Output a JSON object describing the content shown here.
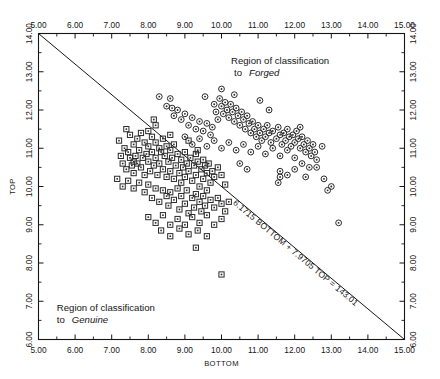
{
  "chart_data": {
    "type": "scatter",
    "title": "",
    "xlabel": "BOTTOM",
    "ylabel": "TOP",
    "xlim": [
      5.0,
      15.0
    ],
    "ylim": [
      6.0,
      14.0
    ],
    "xticks": [
      "5.00",
      "6.00",
      "7.00",
      "8.00",
      "9.00",
      "10.00",
      "11.00",
      "12.00",
      "13.00",
      "14.00",
      "15.00"
    ],
    "yticks": [
      "6.00",
      "7.00",
      "8.00",
      "9.00",
      "10.00",
      "11.00",
      "12.00",
      "13.00",
      "14.00"
    ],
    "xtick_values": [
      5,
      6,
      7,
      8,
      9,
      10,
      11,
      12,
      13,
      14,
      15
    ],
    "ytick_values": [
      6,
      7,
      8,
      9,
      10,
      11,
      12,
      13,
      14
    ],
    "grid": false,
    "legend_position": "none",
    "axes_mirrored": true,
    "annotations": [
      {
        "name": "forged-region-label",
        "line1": "Region of classification",
        "line2": "to",
        "emph": "Forged",
        "x": 11.6,
        "y": 13.2
      },
      {
        "name": "genuine-region-label",
        "line1": "Region of classification",
        "line2": "to",
        "emph": "Genuine",
        "x": 5.5,
        "y": 6.75
      },
      {
        "name": "boundary-equation",
        "text": "6.1715 BOTTOM + 7.9705 TOP = 143.01",
        "rotated": true
      }
    ],
    "boundary_line": {
      "name": "discriminant-boundary",
      "equation": "6.1715 BOTTOM + 7.9705 TOP = 143.01",
      "slope_coef_bottom": 6.1715,
      "slope_coef_top": 7.9705,
      "constant": 143.01,
      "endpoints": [
        [
          5.0,
          14.0
        ],
        [
          15.0,
          6.0
        ]
      ]
    },
    "series": [
      {
        "name": "Genuine",
        "marker": "square-dot",
        "points": [
          [
            7.2,
            11.2
          ],
          [
            7.25,
            10.8
          ],
          [
            7.3,
            10.6
          ],
          [
            7.35,
            11.0
          ],
          [
            7.4,
            10.45
          ],
          [
            7.45,
            10.9
          ],
          [
            7.5,
            11.35
          ],
          [
            7.5,
            10.75
          ],
          [
            7.55,
            10.55
          ],
          [
            7.6,
            11.1
          ],
          [
            7.6,
            10.35
          ],
          [
            7.65,
            10.8
          ],
          [
            7.7,
            11.25
          ],
          [
            7.7,
            10.6
          ],
          [
            7.75,
            10.95
          ],
          [
            7.8,
            11.4
          ],
          [
            7.8,
            10.5
          ],
          [
            7.85,
            10.75
          ],
          [
            7.9,
            11.15
          ],
          [
            7.9,
            10.3
          ],
          [
            7.95,
            10.85
          ],
          [
            8.0,
            11.45
          ],
          [
            8.0,
            11.05
          ],
          [
            8.0,
            10.65
          ],
          [
            8.05,
            10.4
          ],
          [
            8.1,
            11.3
          ],
          [
            8.1,
            10.9
          ],
          [
            8.15,
            10.55
          ],
          [
            8.2,
            11.6
          ],
          [
            8.2,
            11.15
          ],
          [
            8.2,
            10.75
          ],
          [
            8.25,
            10.3
          ],
          [
            8.3,
            11.0
          ],
          [
            8.3,
            10.6
          ],
          [
            8.35,
            10.9
          ],
          [
            8.4,
            11.25
          ],
          [
            8.4,
            10.45
          ],
          [
            8.45,
            10.8
          ],
          [
            8.5,
            11.05
          ],
          [
            8.5,
            10.25
          ],
          [
            8.55,
            10.65
          ],
          [
            8.6,
            10.95
          ],
          [
            8.6,
            10.4
          ],
          [
            8.65,
            10.75
          ],
          [
            8.7,
            11.1
          ],
          [
            8.7,
            10.2
          ],
          [
            8.75,
            10.55
          ],
          [
            8.8,
            10.85
          ],
          [
            8.85,
            10.35
          ],
          [
            8.9,
            10.7
          ],
          [
            8.9,
            10.1
          ],
          [
            8.95,
            10.5
          ],
          [
            9.0,
            10.9
          ],
          [
            9.0,
            10.25
          ],
          [
            9.05,
            10.6
          ],
          [
            9.1,
            10.4
          ],
          [
            9.15,
            10.75
          ],
          [
            9.2,
            10.15
          ],
          [
            9.25,
            10.55
          ],
          [
            9.3,
            10.85
          ],
          [
            9.3,
            10.3
          ],
          [
            9.35,
            10.65
          ],
          [
            9.4,
            10.0
          ],
          [
            9.45,
            10.45
          ],
          [
            9.5,
            10.7
          ],
          [
            9.5,
            10.2
          ],
          [
            9.55,
            10.55
          ],
          [
            9.6,
            10.35
          ],
          [
            9.65,
            10.6
          ],
          [
            9.7,
            10.1
          ],
          [
            9.75,
            10.4
          ],
          [
            9.8,
            10.25
          ],
          [
            9.9,
            10.5
          ],
          [
            10.0,
            10.3
          ],
          [
            10.1,
            10.05
          ],
          [
            7.15,
            10.2
          ],
          [
            7.3,
            10.0
          ],
          [
            7.45,
            10.15
          ],
          [
            7.6,
            9.95
          ],
          [
            7.75,
            10.1
          ],
          [
            7.9,
            9.85
          ],
          [
            8.0,
            10.05
          ],
          [
            8.1,
            9.7
          ],
          [
            8.2,
            9.95
          ],
          [
            8.3,
            9.6
          ],
          [
            8.4,
            9.9
          ],
          [
            8.5,
            9.75
          ],
          [
            8.55,
            9.5
          ],
          [
            8.6,
            9.85
          ],
          [
            8.7,
            9.65
          ],
          [
            8.8,
            9.95
          ],
          [
            8.85,
            9.4
          ],
          [
            8.9,
            9.75
          ],
          [
            9.0,
            9.55
          ],
          [
            9.05,
            9.9
          ],
          [
            9.1,
            9.3
          ],
          [
            9.2,
            9.7
          ],
          [
            9.25,
            9.45
          ],
          [
            9.3,
            9.8
          ],
          [
            9.4,
            9.6
          ],
          [
            9.45,
            9.35
          ],
          [
            9.5,
            9.75
          ],
          [
            9.55,
            9.5
          ],
          [
            9.6,
            9.9
          ],
          [
            9.7,
            9.65
          ],
          [
            9.8,
            9.45
          ],
          [
            9.9,
            9.7
          ],
          [
            10.0,
            9.55
          ],
          [
            10.1,
            9.35
          ],
          [
            10.2,
            9.6
          ],
          [
            8.0,
            9.2
          ],
          [
            8.2,
            9.05
          ],
          [
            8.4,
            9.25
          ],
          [
            8.6,
            9.0
          ],
          [
            8.8,
            9.15
          ],
          [
            9.0,
            9.0
          ],
          [
            9.2,
            9.2
          ],
          [
            9.4,
            9.05
          ],
          [
            9.6,
            9.25
          ],
          [
            9.8,
            9.0
          ],
          [
            10.0,
            9.15
          ],
          [
            8.35,
            8.85
          ],
          [
            8.6,
            8.7
          ],
          [
            8.85,
            8.9
          ],
          [
            9.1,
            8.75
          ],
          [
            9.35,
            8.85
          ],
          [
            9.6,
            8.7
          ],
          [
            9.3,
            8.4
          ],
          [
            10.0,
            7.7
          ],
          [
            7.6,
            10.65
          ],
          [
            7.4,
            11.5
          ],
          [
            8.15,
            11.75
          ],
          [
            8.6,
            11.35
          ],
          [
            9.1,
            11.2
          ],
          [
            9.35,
            10.95
          ]
        ]
      },
      {
        "name": "Forged",
        "marker": "circle-dot",
        "points": [
          [
            8.5,
            12.1
          ],
          [
            8.65,
            12.05
          ],
          [
            8.7,
            11.85
          ],
          [
            8.8,
            12.0
          ],
          [
            8.9,
            11.75
          ],
          [
            9.0,
            11.9
          ],
          [
            9.1,
            11.6
          ],
          [
            9.2,
            11.8
          ],
          [
            9.3,
            11.5
          ],
          [
            9.4,
            11.7
          ],
          [
            9.5,
            11.45
          ],
          [
            9.6,
            11.65
          ],
          [
            9.7,
            11.35
          ],
          [
            9.75,
            11.55
          ],
          [
            9.8,
            12.15
          ],
          [
            9.85,
            11.95
          ],
          [
            9.9,
            11.75
          ],
          [
            9.95,
            12.3
          ],
          [
            10.0,
            12.1
          ],
          [
            10.05,
            11.9
          ],
          [
            10.1,
            12.2
          ],
          [
            10.15,
            12.0
          ],
          [
            10.2,
            11.8
          ],
          [
            10.25,
            12.15
          ],
          [
            10.3,
            11.95
          ],
          [
            10.35,
            11.7
          ],
          [
            10.4,
            12.05
          ],
          [
            10.45,
            11.85
          ],
          [
            10.5,
            11.6
          ],
          [
            10.55,
            11.95
          ],
          [
            10.6,
            11.75
          ],
          [
            10.65,
            11.5
          ],
          [
            10.7,
            11.85
          ],
          [
            10.75,
            11.65
          ],
          [
            10.8,
            11.4
          ],
          [
            10.85,
            11.7
          ],
          [
            10.9,
            11.5
          ],
          [
            10.95,
            11.3
          ],
          [
            11.0,
            11.6
          ],
          [
            11.05,
            11.4
          ],
          [
            11.1,
            11.2
          ],
          [
            11.15,
            11.5
          ],
          [
            11.2,
            11.3
          ],
          [
            11.25,
            11.6
          ],
          [
            11.3,
            11.4
          ],
          [
            11.35,
            11.15
          ],
          [
            11.4,
            11.45
          ],
          [
            11.5,
            11.25
          ],
          [
            11.55,
            11.55
          ],
          [
            11.6,
            11.35
          ],
          [
            11.65,
            11.1
          ],
          [
            11.7,
            11.4
          ],
          [
            11.75,
            11.2
          ],
          [
            11.8,
            11.5
          ],
          [
            11.85,
            11.3
          ],
          [
            11.9,
            11.05
          ],
          [
            11.95,
            11.35
          ],
          [
            12.0,
            11.15
          ],
          [
            12.05,
            11.45
          ],
          [
            12.1,
            11.25
          ],
          [
            12.15,
            11.0
          ],
          [
            12.2,
            11.3
          ],
          [
            12.25,
            11.1
          ],
          [
            12.3,
            10.9
          ],
          [
            12.35,
            11.2
          ],
          [
            12.4,
            11.0
          ],
          [
            12.45,
            10.8
          ],
          [
            12.5,
            11.1
          ],
          [
            12.55,
            10.9
          ],
          [
            12.6,
            10.7
          ],
          [
            9.0,
            11.3
          ],
          [
            9.2,
            11.1
          ],
          [
            9.4,
            11.25
          ],
          [
            9.6,
            11.05
          ],
          [
            9.8,
            11.2
          ],
          [
            10.0,
            11.0
          ],
          [
            10.2,
            11.15
          ],
          [
            10.4,
            10.95
          ],
          [
            10.6,
            11.1
          ],
          [
            10.8,
            10.9
          ],
          [
            11.0,
            11.05
          ],
          [
            11.2,
            10.85
          ],
          [
            11.4,
            11.0
          ],
          [
            11.6,
            10.8
          ],
          [
            11.8,
            10.95
          ],
          [
            12.0,
            10.75
          ],
          [
            12.2,
            10.6
          ],
          [
            12.4,
            10.5
          ],
          [
            10.5,
            10.6
          ],
          [
            10.7,
            10.45
          ],
          [
            11.6,
            10.4
          ],
          [
            11.8,
            10.3
          ],
          [
            12.0,
            10.45
          ],
          [
            12.3,
            10.25
          ],
          [
            12.6,
            10.5
          ],
          [
            12.8,
            10.2
          ],
          [
            13.0,
            10.0
          ],
          [
            11.55,
            10.1
          ],
          [
            11.6,
            10.25
          ],
          [
            12.9,
            9.9
          ],
          [
            13.2,
            9.05
          ],
          [
            8.6,
            12.3
          ],
          [
            8.3,
            12.35
          ],
          [
            9.55,
            12.35
          ],
          [
            10.0,
            12.55
          ],
          [
            10.35,
            12.4
          ],
          [
            11.05,
            12.25
          ],
          [
            11.3,
            12.0
          ],
          [
            12.15,
            11.55
          ],
          [
            12.75,
            11.05
          ]
        ]
      }
    ]
  }
}
